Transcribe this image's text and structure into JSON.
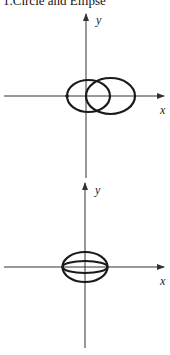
{
  "title": "1.Circle and Ellipse",
  "figures": [
    {
      "name": "figure-1",
      "x_label": "x",
      "y_label": "y",
      "description": "Circle centered at origin and ellipse passing through origin, sharing top and bottom points on y-axis"
    },
    {
      "name": "figure-2",
      "x_label": "x",
      "y_label": "y",
      "description": "Two concentric ellipses centered at origin sharing x-intercepts"
    }
  ],
  "colors": {
    "stroke": "#1a1a1a",
    "axis": "#333333"
  }
}
